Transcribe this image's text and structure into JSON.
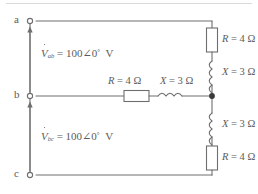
{
  "figure": {
    "type": "electrical-circuit-schematic",
    "line_color": "#6e6e6e",
    "text_color": "#5b5b5b",
    "background": "#ffffff"
  },
  "terminals": [
    {
      "id": "a",
      "label": "a",
      "x": 22,
      "y": 21
    },
    {
      "id": "b",
      "label": "b",
      "x": 22,
      "y": 96
    },
    {
      "id": "c",
      "label": "c",
      "x": 22,
      "y": 175
    }
  ],
  "sources": [
    {
      "id": "v-ab",
      "symbol": "V",
      "subscript": "ab",
      "magnitude": "100",
      "angle_symbol": "∠",
      "angle": "0",
      "degree": "°",
      "unit": "V",
      "equals": "=",
      "full_text": "V̇ab = 100∠0° V",
      "arrow": "up"
    },
    {
      "id": "v-bc",
      "symbol": "V",
      "subscript": "bc",
      "magnitude": "100",
      "angle_symbol": "∠",
      "angle": "0",
      "degree": "°",
      "unit": "V",
      "equals": "=",
      "full_text": "V̇bc = 100∠0° V",
      "arrow": "up"
    }
  ],
  "components": [
    {
      "id": "r-top-right",
      "kind": "resistor",
      "symbol": "R",
      "equals": "=",
      "value": "4",
      "unit": "Ω",
      "label": "R = 4 Ω",
      "orientation": "vertical",
      "branch": "right-upper"
    },
    {
      "id": "x-top-right",
      "kind": "inductor",
      "symbol": "X",
      "equals": "=",
      "value": "3",
      "unit": "Ω",
      "label": "X = 3 Ω",
      "orientation": "vertical",
      "branch": "right-upper"
    },
    {
      "id": "r-middle",
      "kind": "resistor",
      "symbol": "R",
      "equals": "=",
      "value": "4",
      "unit": "Ω",
      "label": "R = 4 Ω",
      "orientation": "horizontal",
      "branch": "middle"
    },
    {
      "id": "x-middle",
      "kind": "inductor",
      "symbol": "X",
      "equals": "=",
      "value": "3",
      "unit": "Ω",
      "label": "X = 3 Ω",
      "orientation": "horizontal",
      "branch": "middle"
    },
    {
      "id": "x-bottom-right",
      "kind": "inductor",
      "symbol": "X",
      "equals": "=",
      "value": "3",
      "unit": "Ω",
      "label": "X = 3 Ω",
      "orientation": "vertical",
      "branch": "right-lower"
    },
    {
      "id": "r-bottom-right",
      "kind": "resistor",
      "symbol": "R",
      "equals": "=",
      "value": "4",
      "unit": "Ω",
      "label": "R = 4 Ω",
      "orientation": "vertical",
      "branch": "right-lower"
    }
  ],
  "junction": {
    "id": "node-right-mid",
    "x": 212,
    "y": 96
  }
}
